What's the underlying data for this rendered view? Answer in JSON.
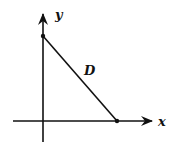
{
  "diagram": {
    "axes": {
      "x_label": "x",
      "y_label": "y"
    },
    "region_label": "D",
    "segment": {
      "from": "y-intercept",
      "to": "x-intercept"
    },
    "colors": {
      "stroke": "#111111",
      "background": "#ffffff"
    }
  }
}
